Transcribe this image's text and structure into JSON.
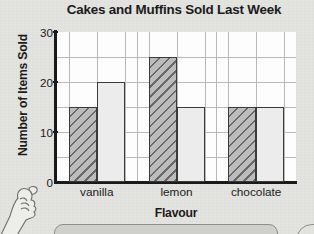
{
  "chart_data": {
    "type": "bar",
    "title": "Cakes and Muffins Sold Last Week",
    "xlabel": "Flavour",
    "ylabel": "Number of Items Sold",
    "categories": [
      "vanilla",
      "lemon",
      "chocolate"
    ],
    "series": [
      {
        "name": "cakes",
        "style": "hatched",
        "values": [
          15,
          25,
          15
        ]
      },
      {
        "name": "muffins",
        "style": "plain",
        "values": [
          20,
          15,
          15
        ]
      }
    ],
    "ylim": [
      0,
      30
    ],
    "yticks": [
      0,
      10,
      20,
      30
    ],
    "ytick_labels": [
      "0",
      "10",
      "20",
      "30"
    ],
    "gridlines": {
      "horizontal_interval": 5,
      "vertical": true,
      "visible": true
    },
    "legend": {
      "visible": false,
      "position": "none"
    },
    "bar_colors": {
      "hatched_fill": "#bcbcbc",
      "hatched_lines": "#5a5a5a",
      "plain_fill": "#ececec",
      "outline": "#3a3a3a"
    },
    "axis_color": "#1a1a1a",
    "plot_background": "#fdfdfd",
    "page_background": "#d4d4d0"
  },
  "decorations": {
    "hand_illustration": "pointing-hand",
    "bottom_box": "rounded-answer-box",
    "corner_arc": "rounded-corner-shape"
  }
}
